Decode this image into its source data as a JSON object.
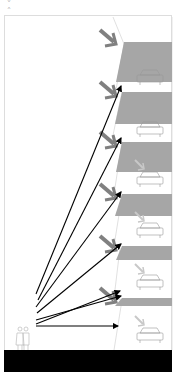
{
  "navigation": {
    "down_icon": "chevron-down",
    "down_glyph": "˅",
    "up_icon": "chevron-up",
    "up_glyph": "˄"
  },
  "diagram": {
    "type": "architectural-section",
    "colors": {
      "plate": "#a6a6a6",
      "sun_arrow": "#808080",
      "reflected_arrow": "#c8c8c8",
      "view_line": "#000000",
      "ground": "#000000",
      "outline": "#d0d0d0"
    },
    "levels": [
      {
        "name": "level-1",
        "has_car": true,
        "sun_arrow": "strong"
      },
      {
        "name": "level-2",
        "has_car": true,
        "sun_arrow": "strong"
      },
      {
        "name": "level-3",
        "has_car": true,
        "sun_arrow": "strong"
      },
      {
        "name": "level-4",
        "has_car": true,
        "sun_arrow": "strong"
      },
      {
        "name": "level-5",
        "has_car": true,
        "sun_arrow": "strong"
      },
      {
        "name": "level-6",
        "has_car": true,
        "sun_arrow": "strong"
      },
      {
        "name": "level-7",
        "has_car": true,
        "sun_arrow": "none"
      }
    ],
    "view_lines": 7,
    "observer": "pedestrians"
  }
}
